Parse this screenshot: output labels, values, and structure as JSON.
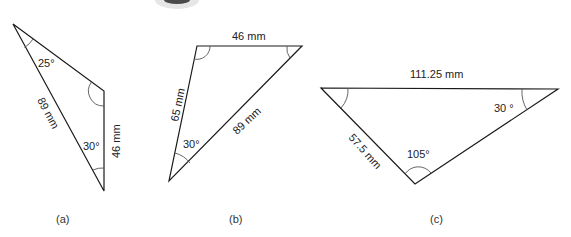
{
  "figures": [
    {
      "id": "a",
      "caption": "(a)",
      "vertices": [
        [
          13,
          24
        ],
        [
          104,
          91
        ],
        [
          104,
          191
        ]
      ],
      "sides": [
        {
          "label": "89 mm",
          "between": "top-left to bottom"
        },
        {
          "label": "46 mm",
          "between": "right-mid to bottom"
        }
      ],
      "angles": [
        {
          "label": "25°",
          "at": "top-left"
        },
        {
          "label": "30°",
          "at": "bottom"
        },
        {
          "label": "",
          "at": "right-mid",
          "marked": true
        }
      ]
    },
    {
      "id": "b",
      "caption": "(b)",
      "vertices": [
        [
          197,
          46
        ],
        [
          302,
          46
        ],
        [
          169,
          181
        ]
      ],
      "sides": [
        {
          "label": "46 mm",
          "between": "top-left to top-right"
        },
        {
          "label": "65 mm",
          "between": "top-left to bottom-left"
        },
        {
          "label": "89 mm",
          "between": "top-right to bottom-left"
        }
      ],
      "angles": [
        {
          "label": "30°",
          "at": "bottom-left"
        },
        {
          "label": "",
          "at": "top-left",
          "marked": true
        },
        {
          "label": "",
          "at": "top-right",
          "marked": true
        }
      ]
    },
    {
      "id": "c",
      "caption": "(c)",
      "vertices": [
        [
          321,
          88
        ],
        [
          558,
          89
        ],
        [
          415,
          184
        ]
      ],
      "sides": [
        {
          "label": "111.25 mm",
          "between": "left to right"
        },
        {
          "label": "57.5 mm",
          "between": "left to bottom"
        }
      ],
      "angles": [
        {
          "label": "30 °",
          "at": "right"
        },
        {
          "label": "105°",
          "at": "bottom"
        },
        {
          "label": "",
          "at": "left",
          "marked": true
        }
      ]
    }
  ],
  "labels": {
    "a_side1": "89 mm",
    "a_side2": "46 mm",
    "a_ang1": "25°",
    "a_ang2": "30°",
    "a_cap": "(a)",
    "b_top": "46 mm",
    "b_left": "65 mm",
    "b_hyp": "89 mm",
    "b_ang": "30°",
    "b_cap": "(b)",
    "c_top": "111.25 mm",
    "c_left": "57.5 mm",
    "c_ang_right": "30 °",
    "c_ang_bottom": "105°",
    "c_cap": "(c)"
  }
}
